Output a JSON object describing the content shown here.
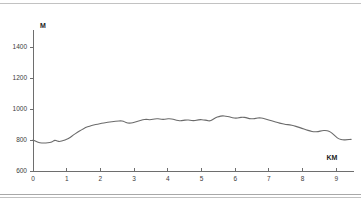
{
  "chart_data": {
    "type": "line",
    "title": "",
    "subtitle": "",
    "xlabel": "KM",
    "ylabel": "M",
    "xlim": [
      0,
      9.5
    ],
    "ylim": [
      600,
      1500
    ],
    "grid": false,
    "legend": false,
    "x_ticks": [
      0,
      1,
      2,
      3,
      4,
      5,
      6,
      7,
      8,
      9
    ],
    "x_tick_labels": [
      "0",
      "1",
      "2",
      "3",
      "4",
      "5",
      "6",
      "7",
      "8",
      "9"
    ],
    "y_ticks": [
      600,
      800,
      1000,
      1200,
      1400
    ],
    "y_tick_labels": [
      "600",
      "800",
      "1000",
      "1200",
      "1400"
    ],
    "series": [
      {
        "name": "elevation",
        "color": "#6b6b6b",
        "x": [
          0.0,
          0.1,
          0.2,
          0.32,
          0.44,
          0.56,
          0.64,
          0.72,
          0.8,
          0.9,
          1.0,
          1.1,
          1.2,
          1.32,
          1.44,
          1.56,
          1.68,
          1.8,
          1.92,
          2.04,
          2.16,
          2.28,
          2.4,
          2.5,
          2.6,
          2.68,
          2.76,
          2.86,
          2.96,
          3.06,
          3.16,
          3.26,
          3.36,
          3.46,
          3.56,
          3.66,
          3.76,
          3.86,
          3.96,
          4.06,
          4.16,
          4.26,
          4.36,
          4.46,
          4.56,
          4.66,
          4.76,
          4.86,
          4.96,
          5.06,
          5.16,
          5.24,
          5.32,
          5.42,
          5.52,
          5.62,
          5.72,
          5.82,
          5.92,
          6.02,
          6.12,
          6.22,
          6.32,
          6.42,
          6.52,
          6.62,
          6.72,
          6.82,
          6.92,
          7.02,
          7.14,
          7.26,
          7.38,
          7.5,
          7.62,
          7.74,
          7.86,
          7.98,
          8.1,
          8.22,
          8.34,
          8.46,
          8.58,
          8.68,
          8.78,
          8.88,
          8.98,
          9.08,
          9.2,
          9.32,
          9.44
        ],
        "y": [
          800,
          790,
          782,
          780,
          782,
          786,
          800,
          792,
          790,
          796,
          804,
          816,
          832,
          850,
          866,
          880,
          890,
          898,
          902,
          908,
          912,
          916,
          920,
          922,
          924,
          922,
          912,
          908,
          912,
          918,
          924,
          930,
          934,
          930,
          934,
          938,
          936,
          932,
          936,
          938,
          934,
          928,
          924,
          926,
          930,
          928,
          924,
          928,
          932,
          930,
          926,
          922,
          930,
          944,
          952,
          956,
          954,
          950,
          944,
          940,
          944,
          948,
          944,
          938,
          936,
          940,
          944,
          940,
          934,
          928,
          920,
          912,
          906,
          900,
          898,
          892,
          884,
          876,
          866,
          858,
          852,
          854,
          860,
          862,
          858,
          844,
          822,
          806,
          800,
          802,
          804
        ]
      }
    ],
    "annotations": []
  },
  "axis": {
    "y_title": "M",
    "x_title": "KM"
  }
}
